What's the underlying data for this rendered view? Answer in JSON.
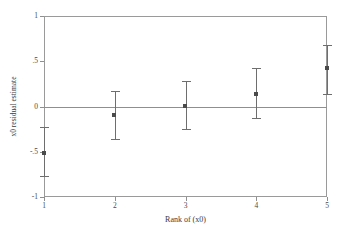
{
  "chart_data": {
    "type": "scatter",
    "title": "",
    "subtitle": "",
    "xlabel": "Rank of (x0)",
    "ylabel": "x0 residual estimate",
    "x": [
      1,
      2,
      3,
      4,
      5
    ],
    "categories": [
      "1",
      "2",
      "3",
      "4",
      "5"
    ],
    "values": [
      -0.51,
      -0.09,
      0.01,
      0.14,
      0.42
    ],
    "error_low": [
      -0.78,
      -0.37,
      -0.26,
      -0.14,
      0.13
    ],
    "error_high": [
      -0.23,
      0.17,
      0.28,
      0.42,
      0.68
    ],
    "series": [
      {
        "name": "x0 residual estimate",
        "values": [
          -0.51,
          -0.09,
          0.01,
          0.14,
          0.42
        ],
        "error_low": [
          -0.78,
          -0.37,
          -0.26,
          -0.14,
          0.13
        ],
        "error_high": [
          -0.23,
          0.17,
          0.28,
          0.42,
          0.68
        ]
      }
    ],
    "xlim": [
      1,
      5
    ],
    "ylim": [
      -1,
      1
    ],
    "xticks": [
      1,
      2,
      3,
      4,
      5
    ],
    "xtick_labels": [
      "1",
      "2",
      "3",
      "4",
      "5"
    ],
    "yticks": [
      1,
      0.5,
      0,
      -0.5,
      -1
    ],
    "ytick_labels": [
      "1",
      ".5",
      "0",
      "-.5",
      "-1"
    ],
    "grid": false,
    "legend": "none",
    "reference_lines": [
      {
        "axis": "y",
        "value": 0
      }
    ],
    "marker": "square",
    "colors": {
      "marker": "#4a4a4a",
      "errorbar": "#6e6e6e",
      "reference_line": "#8f8f8f",
      "frame": "#9a9a9a",
      "background": "#ffffff",
      "text": "#3a3a3a"
    }
  }
}
